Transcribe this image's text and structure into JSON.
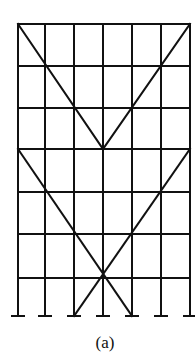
{
  "figure": {
    "caption": "(a)",
    "stroke_color": "#111111",
    "columns_x": [
      18,
      45,
      74,
      103,
      132,
      161,
      190
    ],
    "floors_y": [
      24,
      66,
      108,
      149,
      192,
      234,
      278
    ],
    "base_y": 316,
    "bays": 6,
    "storeys": 7,
    "braces": [
      {
        "from": [
          18,
          24
        ],
        "to": [
          103,
          149
        ]
      },
      {
        "from": [
          190,
          24
        ],
        "to": [
          103,
          149
        ]
      },
      {
        "from": [
          18,
          149
        ],
        "to": [
          132,
          316
        ]
      },
      {
        "from": [
          190,
          149
        ],
        "to": [
          74,
          316
        ]
      }
    ]
  }
}
